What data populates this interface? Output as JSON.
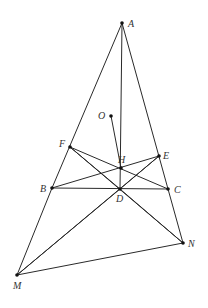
{
  "figure": {
    "type": "geometry-diagram",
    "points": [
      {
        "name": "A"
      },
      {
        "name": "O"
      },
      {
        "name": "F"
      },
      {
        "name": "H"
      },
      {
        "name": "E"
      },
      {
        "name": "B"
      },
      {
        "name": "D"
      },
      {
        "name": "C"
      },
      {
        "name": "N"
      },
      {
        "name": "M"
      }
    ],
    "segments": [
      [
        "A",
        "B"
      ],
      [
        "A",
        "C"
      ],
      [
        "A",
        "D"
      ],
      [
        "B",
        "C"
      ],
      [
        "B",
        "M"
      ],
      [
        "C",
        "N"
      ],
      [
        "M",
        "N"
      ],
      [
        "O",
        "H"
      ],
      [
        "F",
        "C"
      ],
      [
        "F",
        "D"
      ],
      [
        "F",
        "N"
      ],
      [
        "B",
        "E"
      ],
      [
        "E",
        "D"
      ],
      [
        "E",
        "M"
      ],
      [
        "D",
        "M"
      ],
      [
        "D",
        "N"
      ]
    ]
  }
}
